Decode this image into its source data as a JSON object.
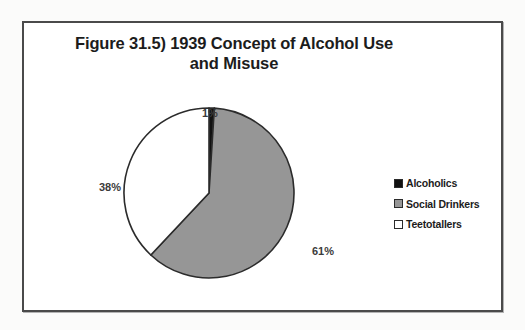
{
  "chart_data": {
    "type": "pie",
    "title": "Figure 31.5) 1939 Concept of Alcohol Use and Misuse",
    "title_line1": "Figure 31.5) 1939 Concept of Alcohol Use",
    "title_line2": "and Misuse",
    "categories": [
      "Alcoholics",
      "Social Drinkers",
      "Teetotallers"
    ],
    "values": [
      1,
      61,
      38
    ],
    "value_labels": [
      "1%",
      "61%",
      "38%"
    ],
    "colors": [
      "#111111",
      "#969696",
      "#ffffff"
    ],
    "slice_border_color": "#2b2b2b",
    "start_angle_deg": 0,
    "direction": "clockwise",
    "legend_position": "right",
    "grid": false,
    "xlabel": "",
    "ylabel": "",
    "series": [
      {
        "name": "1939 Concept of Alcohol Use and Misuse",
        "values": [
          1,
          61,
          38
        ]
      }
    ]
  },
  "legend": {
    "items": [
      {
        "label": "Alcoholics",
        "color": "#111111"
      },
      {
        "label": "Social Drinkers",
        "color": "#969696"
      },
      {
        "label": "Teetotallers",
        "color": "#ffffff"
      }
    ]
  },
  "labels": {
    "alcoholics": "1%",
    "social_drinkers": "61%",
    "teetotallers": "38%"
  }
}
